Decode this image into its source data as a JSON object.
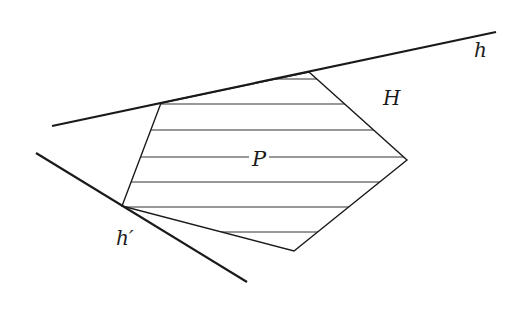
{
  "figure": {
    "labels": {
      "h": "h",
      "H": "H",
      "P": "P",
      "h_prime": "h′"
    },
    "colors": {
      "stroke": "#1a1a1a",
      "hatch": "#333333",
      "background": "#ffffff"
    },
    "lines": {
      "h": {
        "x1": 52,
        "y1": 126,
        "x2": 496,
        "y2": 32
      },
      "h_prime": {
        "x1": 36,
        "y1": 153,
        "x2": 247,
        "y2": 282
      }
    },
    "polygon_P": {
      "vertices": [
        [
          161,
          103
        ],
        [
          309,
          72
        ],
        [
          407,
          160
        ],
        [
          294,
          251
        ],
        [
          122,
          206
        ]
      ]
    },
    "hatch_y": [
      79,
      104,
      130,
      157,
      182,
      207,
      232
    ]
  }
}
